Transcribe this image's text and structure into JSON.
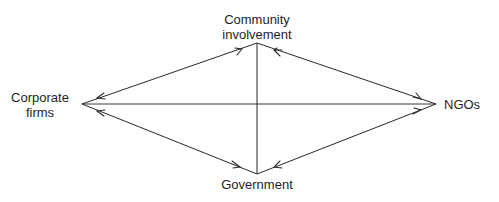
{
  "diagram": {
    "type": "relationship-diamond",
    "nodes": {
      "top": {
        "label_line1": "Community",
        "label_line2": "involvement"
      },
      "left": {
        "label_line1": "Corporate",
        "label_line2": "firms"
      },
      "right": {
        "label": "NGOs"
      },
      "bottom": {
        "label": "Government"
      }
    },
    "edges": [
      {
        "from": "Corporate firms",
        "to": "Community involvement",
        "arrows": "both"
      },
      {
        "from": "Community involvement",
        "to": "NGOs",
        "arrows": "both"
      },
      {
        "from": "NGOs",
        "to": "Government",
        "arrows": "both"
      },
      {
        "from": "Government",
        "to": "Corporate firms",
        "arrows": "both"
      },
      {
        "from": "Corporate firms",
        "to": "NGOs",
        "arrows": "none"
      },
      {
        "from": "Community involvement",
        "to": "Government",
        "arrows": "none"
      }
    ],
    "line_color": "#2a2a2a",
    "text_color": "#1e1e1e"
  }
}
